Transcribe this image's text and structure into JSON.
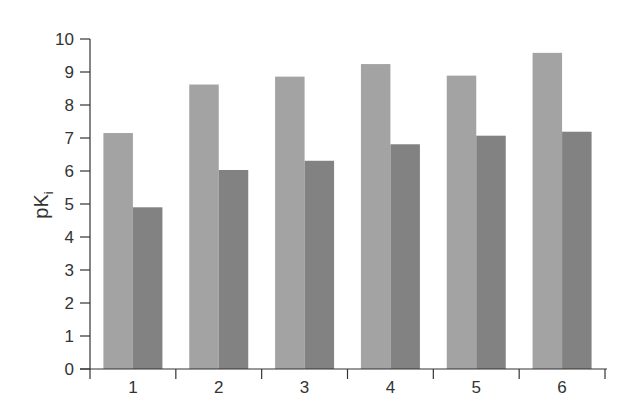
{
  "chart_data": {
    "type": "bar",
    "title": "",
    "xlabel": "",
    "ylabel": "pK",
    "ylabel_subscript": "i",
    "categories": [
      "1",
      "2",
      "3",
      "4",
      "5",
      "6"
    ],
    "series": [
      {
        "name": "series-1",
        "color": "#a3a3a3",
        "values": [
          7.15,
          8.62,
          8.86,
          9.24,
          8.89,
          9.58
        ]
      },
      {
        "name": "series-2",
        "color": "#828282",
        "values": [
          4.9,
          6.03,
          6.31,
          6.81,
          7.07,
          7.19
        ]
      }
    ],
    "ylim": [
      0,
      10
    ],
    "yticks": [
      "0",
      "1",
      "2",
      "3",
      "4",
      "5",
      "6",
      "7",
      "8",
      "9",
      "10"
    ],
    "grid": false,
    "legend": "none"
  }
}
